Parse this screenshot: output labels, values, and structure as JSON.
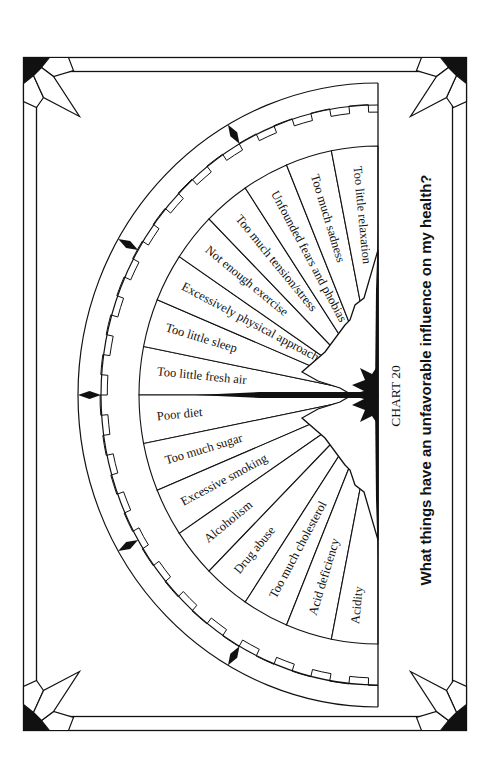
{
  "title": "What things have an unfavorable influence on my health?",
  "chart_label": "CHART 20",
  "colors": {
    "ink": "#111111",
    "paper": "#ffffff"
  },
  "wheel": {
    "upper_slices": [
      {
        "label": "Too little fresh air"
      },
      {
        "label": "Too little sleep"
      },
      {
        "label": "Excessively physical approach"
      },
      {
        "label": "Not enough exercise"
      },
      {
        "label": "Too much tension/stress"
      },
      {
        "label": "Unfounded fears and phobias"
      },
      {
        "label": "Too much sadness"
      },
      {
        "label": "Too little relaxation"
      }
    ],
    "lower_slices": [
      {
        "label": "Poor diet"
      },
      {
        "label": "Too much sugar"
      },
      {
        "label": "Excessive smoking"
      },
      {
        "label": "Alcoholism"
      },
      {
        "label": "Drug abuse"
      },
      {
        "label": "Too much cholesterol"
      },
      {
        "label": "Acid deficiency"
      },
      {
        "label": "Acidity"
      }
    ]
  }
}
